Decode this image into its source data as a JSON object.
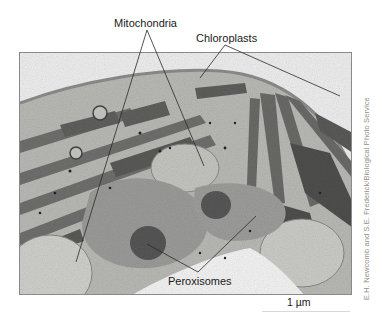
{
  "figure": {
    "image_description": "Transmission electron micrograph of a plant leaf cell showing chloroplasts, mitochondria and peroxisomes",
    "labels": {
      "mitochondria": "Mitochondria",
      "chloroplasts": "Chloroplasts",
      "peroxisomes": "Peroxisomes"
    },
    "scale_bar": {
      "label": "1 µm"
    },
    "credit": "E.H. Newcomb and S.E. Frederick/Biological Photo Service"
  },
  "colors": {
    "background": "#ffffff",
    "cytoplasm": "#b8b8b4",
    "chloroplast_band": "#6e6e6c",
    "peroxisome_body": "#9a9a98",
    "peroxisome_core": "#555555",
    "vacuole": "#f0f0f0",
    "leader_line": "#2a2a2a",
    "credit_text": "#8f8f8f"
  }
}
